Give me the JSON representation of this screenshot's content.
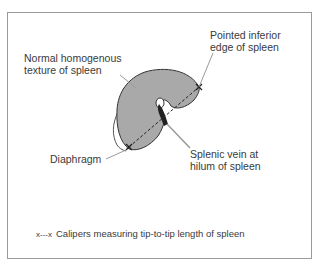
{
  "diagram": {
    "labels": {
      "texture_line1": "Normal homogenous",
      "texture_line2": "texture of spleen",
      "edge_line1": "Pointed inferior",
      "edge_line2": "edge of spleen",
      "diaphragm": "Diaphragm",
      "vein_line1": "Splenic vein at",
      "vein_line2": "hilum of spleen"
    },
    "legend": {
      "symbol": "x---x",
      "text": "Calipers measuring tip-to-tip length of spleen"
    },
    "colors": {
      "spleen_fill": "#a9a9a9",
      "outline": "#333333",
      "vein": "#222222",
      "leader": "#9a9a9a",
      "frame": "#9a9a9a"
    }
  }
}
